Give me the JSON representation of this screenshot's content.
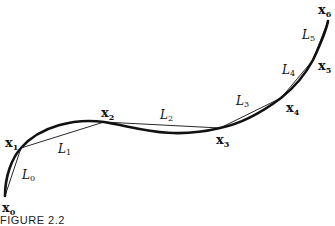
{
  "figure": {
    "caption": "FIGURE 2.2",
    "points": [
      {
        "name": "x",
        "sub": "0",
        "x": 5,
        "y": 196
      },
      {
        "name": "x",
        "sub": "1",
        "x": 21,
        "y": 148
      },
      {
        "name": "x",
        "sub": "2",
        "x": 104,
        "y": 122
      },
      {
        "name": "x",
        "sub": "3",
        "x": 220,
        "y": 128
      },
      {
        "name": "x",
        "sub": "4",
        "x": 281,
        "y": 98
      },
      {
        "name": "x",
        "sub": "5",
        "x": 313,
        "y": 60
      },
      {
        "name": "x",
        "sub": "6",
        "x": 328,
        "y": 21
      }
    ],
    "lengths": [
      {
        "name": "L",
        "sub": "0"
      },
      {
        "name": "L",
        "sub": "1"
      },
      {
        "name": "L",
        "sub": "2"
      },
      {
        "name": "L",
        "sub": "3"
      },
      {
        "name": "L",
        "sub": "4"
      },
      {
        "name": "L",
        "sub": "5"
      }
    ]
  }
}
